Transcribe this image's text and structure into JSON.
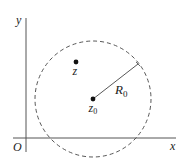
{
  "diagram": {
    "type": "complex-plane-disk",
    "axes": {
      "x_label": "x",
      "y_label": "y",
      "origin_label": "O"
    },
    "circle": {
      "style": "dashed",
      "center_label": "z",
      "center_subscript": "0",
      "radius_label": "R",
      "radius_subscript": "0"
    },
    "points": [
      {
        "label": "z",
        "subscript": ""
      },
      {
        "label": "z",
        "subscript": "0"
      }
    ],
    "colors": {
      "stroke": "#333333",
      "axis": "#555555",
      "background": "#ffffff"
    }
  }
}
